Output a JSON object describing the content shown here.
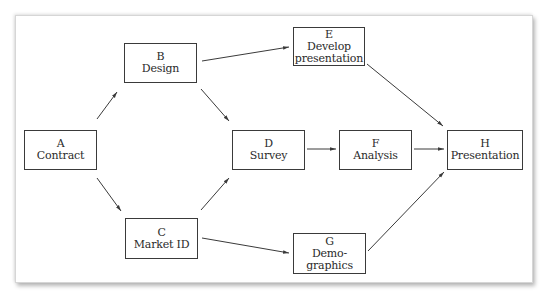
{
  "diagram": {
    "type": "activity-network",
    "nodes": [
      {
        "id": "A",
        "letter": "A",
        "lines": [
          "Contract"
        ]
      },
      {
        "id": "B",
        "letter": "B",
        "lines": [
          "Design"
        ]
      },
      {
        "id": "C",
        "letter": "C",
        "lines": [
          "Market ID"
        ]
      },
      {
        "id": "D",
        "letter": "D",
        "lines": [
          "Survey"
        ]
      },
      {
        "id": "E",
        "letter": "E",
        "lines": [
          "Develop",
          "presentation"
        ]
      },
      {
        "id": "F",
        "letter": "F",
        "lines": [
          "Analysis"
        ]
      },
      {
        "id": "G",
        "letter": "G",
        "lines": [
          "Demo-",
          "graphics"
        ]
      },
      {
        "id": "H",
        "letter": "H",
        "lines": [
          "Presentation"
        ]
      }
    ],
    "edges": [
      {
        "from": "A",
        "to": "B"
      },
      {
        "from": "A",
        "to": "C"
      },
      {
        "from": "B",
        "to": "D"
      },
      {
        "from": "B",
        "to": "E"
      },
      {
        "from": "C",
        "to": "D"
      },
      {
        "from": "C",
        "to": "G"
      },
      {
        "from": "D",
        "to": "F"
      },
      {
        "from": "E",
        "to": "H"
      },
      {
        "from": "F",
        "to": "H"
      },
      {
        "from": "G",
        "to": "H"
      }
    ],
    "colors": {
      "line": "#3a3a3a",
      "text": "#2a2a2a",
      "background": "#ffffff"
    }
  }
}
